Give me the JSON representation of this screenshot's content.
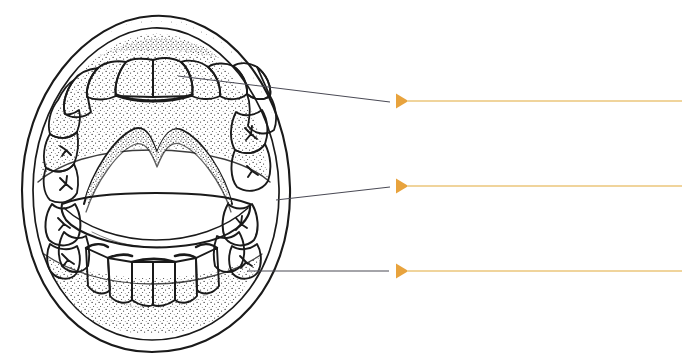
{
  "figure": {
    "caption": "",
    "background_color": "#FFFFFF",
    "ink_color": "#1A1A1A",
    "leader_line_color": "#4A4A55",
    "arrow_color": "#E8A33D",
    "rule_color": "#F2D9A8"
  },
  "drawing": {
    "name": "open-mouth-dentition",
    "style": "hand-drawn pen-and-ink line art with stipple shading",
    "parts": [
      {
        "name": "upper-lip",
        "label": ""
      },
      {
        "name": "lower-lip",
        "label": ""
      },
      {
        "name": "upper-dental-arch",
        "label": ""
      },
      {
        "name": "lower-dental-arch",
        "label": ""
      },
      {
        "name": "upper-central-incisors",
        "label": ""
      },
      {
        "name": "upper-molars",
        "label": ""
      },
      {
        "name": "lower-molars",
        "label": ""
      },
      {
        "name": "lower-incisors",
        "label": ""
      },
      {
        "name": "hard-palate",
        "label": ""
      },
      {
        "name": "tongue",
        "label": ""
      }
    ]
  },
  "callouts": [
    {
      "id": 1,
      "label": "",
      "target_part": "upper-central-incisor",
      "leader_start": {
        "x": 178,
        "y": 76
      },
      "leader_end": {
        "x": 390,
        "y": 102
      },
      "arrow_x": 396,
      "rule_y": 101,
      "rule_end_x": 682
    },
    {
      "id": 2,
      "label": "",
      "target_part": "lower-molar",
      "leader_start": {
        "x": 276,
        "y": 200
      },
      "leader_end": {
        "x": 390,
        "y": 187
      },
      "arrow_x": 396,
      "rule_y": 186,
      "rule_end_x": 682
    },
    {
      "id": 3,
      "label": "",
      "target_part": "lower-lateral-incisor",
      "leader_start": {
        "x": 247,
        "y": 271
      },
      "leader_end": {
        "x": 389,
        "y": 271
      },
      "arrow_x": 396,
      "rule_y": 271,
      "rule_end_x": 682
    }
  ]
}
